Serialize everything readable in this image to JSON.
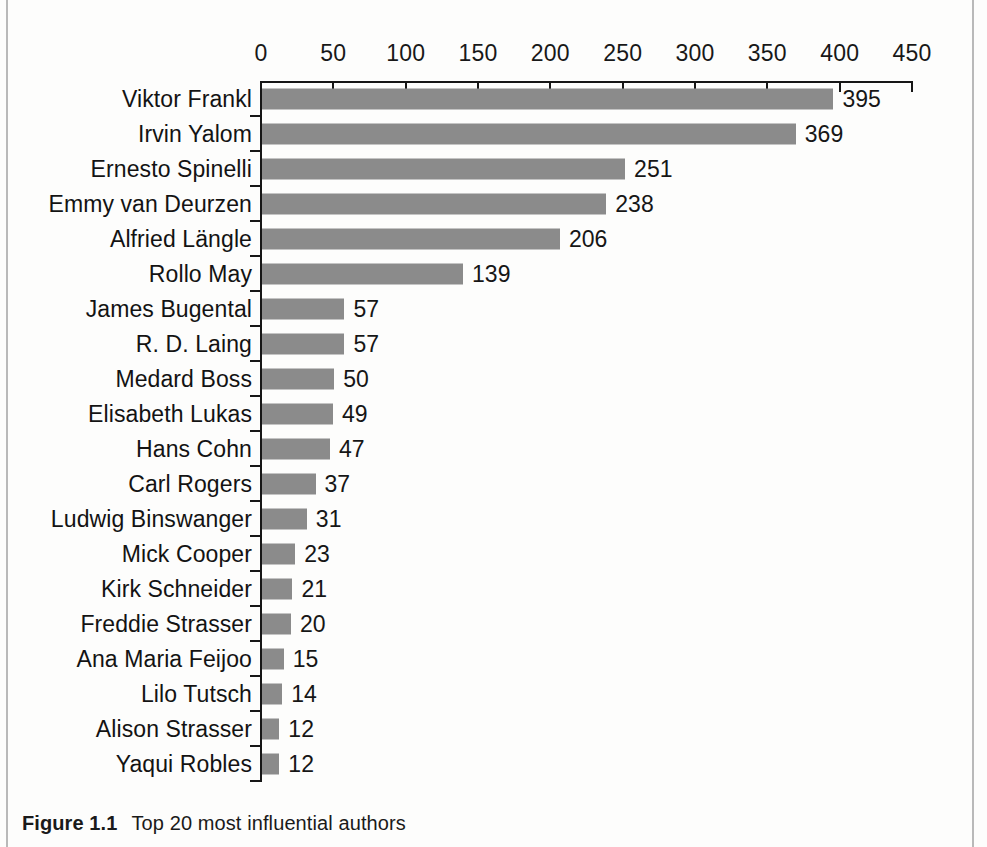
{
  "figure": {
    "caption_label": "Figure 1.1",
    "caption_text": "Top 20 most influential authors"
  },
  "colors": {
    "bar": "#8b8b8b",
    "axis": "#161616",
    "text": "#161616",
    "page_rule": "#b9b9b9",
    "background": "#fdfdfc"
  },
  "chart_data": {
    "type": "bar",
    "orientation": "horizontal",
    "title": "Top 20 most influential authors",
    "xlabel": "",
    "ylabel": "",
    "xlim": [
      0,
      450
    ],
    "xticks": [
      0,
      50,
      100,
      150,
      200,
      250,
      300,
      350,
      400,
      450
    ],
    "grid": false,
    "legend": false,
    "axis_position": "top",
    "data_labels": true,
    "categories": [
      "Viktor Frankl",
      "Irvin Yalom",
      "Ernesto Spinelli",
      "Emmy van Deurzen",
      "Alfried Längle",
      "Rollo May",
      "James Bugental",
      "R. D. Laing",
      "Medard Boss",
      "Elisabeth Lukas",
      "Hans Cohn",
      "Carl Rogers",
      "Ludwig Binswanger",
      "Mick Cooper",
      "Kirk Schneider",
      "Freddie Strasser",
      "Ana Maria Feijoo",
      "Lilo Tutsch",
      "Alison Strasser",
      "Yaqui Robles"
    ],
    "values": [
      395,
      369,
      251,
      238,
      206,
      139,
      57,
      57,
      50,
      49,
      47,
      37,
      31,
      23,
      21,
      20,
      15,
      14,
      12,
      12
    ]
  }
}
